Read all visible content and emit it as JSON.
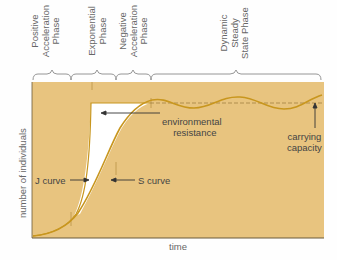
{
  "phases": [
    {
      "line1": "Positive",
      "line2": "Acceleration",
      "line3": "Phase"
    },
    {
      "line1": "Exponential",
      "line2": "Phase",
      "line3": ""
    },
    {
      "line1": "Negative",
      "line2": "Acceleration",
      "line3": "Phase"
    },
    {
      "line1": "Dynamic",
      "line2": "Steady",
      "line3": "State Phase"
    }
  ],
  "annotations": {
    "environmental_resistance_1": "environmental",
    "environmental_resistance_2": "resistance",
    "carrying_capacity_1": "carrying",
    "carrying_capacity_2": "capacity",
    "j_curve": "J curve",
    "s_curve": "S curve"
  },
  "axes": {
    "ylabel": "number of individuals",
    "xlabel": "time"
  },
  "colors": {
    "background": "#e8c47f",
    "curve": "#c8961e",
    "white_region": "#ffffff",
    "axis": "#6b5a3a"
  }
}
